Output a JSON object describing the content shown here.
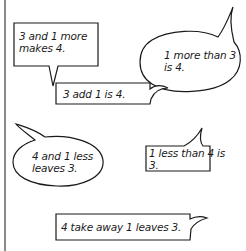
{
  "page": {
    "background": "#ffffff",
    "margin_line_color": "#8a8a8a",
    "ink_color": "#1a1a1a"
  },
  "bubbles": [
    {
      "id": "b1",
      "shape": "rectangle",
      "tail": "down",
      "lines": [
        "3 and 1 more",
        "makes 4."
      ]
    },
    {
      "id": "b2",
      "shape": "ellipse",
      "tail": "up-right",
      "lines": [
        "1 more than 3",
        "is 4."
      ]
    },
    {
      "id": "b3",
      "shape": "rectangle",
      "tail": "right",
      "lines": [
        "3 add 1 is 4."
      ]
    },
    {
      "id": "b4",
      "shape": "ellipse",
      "tail": "up-left",
      "lines": [
        "4 and 1 less",
        "leaves 3."
      ]
    },
    {
      "id": "b5",
      "shape": "rectangle",
      "tail": "up",
      "lines": [
        "1 less than 4 is",
        "3."
      ]
    },
    {
      "id": "b6",
      "shape": "rectangle",
      "tail": "right",
      "lines": [
        "4 take away 1 leaves 3."
      ]
    }
  ]
}
